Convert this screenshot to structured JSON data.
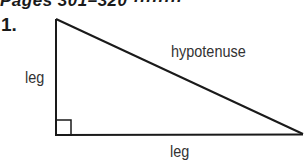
{
  "header": {
    "clipped_text": "Pages 301–320 ········"
  },
  "problem": {
    "number": "1."
  },
  "diagram": {
    "type": "right-triangle",
    "vertices": {
      "top": [
        56,
        19
      ],
      "right_angle": [
        56,
        135
      ],
      "right": [
        303,
        134
      ]
    },
    "right_angle_marker": {
      "x": 56,
      "y": 120,
      "size": 15
    },
    "stroke_color": "#1a1a1a",
    "labels": {
      "left_leg": "leg",
      "hypotenuse": "hypotenuse",
      "bottom_leg": "leg"
    }
  }
}
